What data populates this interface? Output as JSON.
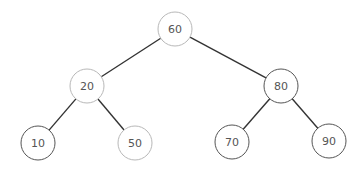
{
  "diagram": {
    "type": "binary-search-tree",
    "colors": {
      "edge": "#333333",
      "border_light": "#b8b8b8",
      "border_dark": "#555555",
      "label": "#555555",
      "background": "#ffffff"
    },
    "nodes": [
      {
        "id": "n60",
        "label": "60",
        "x": 175,
        "y": 29,
        "r": 17,
        "border": "light"
      },
      {
        "id": "n20",
        "label": "20",
        "x": 87,
        "y": 86,
        "r": 17,
        "border": "light"
      },
      {
        "id": "n80",
        "label": "80",
        "x": 281,
        "y": 86,
        "r": 17,
        "border": "dark"
      },
      {
        "id": "n10",
        "label": "10",
        "x": 38,
        "y": 143,
        "r": 17,
        "border": "dark"
      },
      {
        "id": "n50",
        "label": "50",
        "x": 135,
        "y": 143,
        "r": 17,
        "border": "light"
      },
      {
        "id": "n70",
        "label": "70",
        "x": 232,
        "y": 142,
        "r": 17,
        "border": "dark"
      },
      {
        "id": "n90",
        "label": "90",
        "x": 329,
        "y": 141,
        "r": 17,
        "border": "dark"
      }
    ],
    "edges": [
      {
        "from": "n60",
        "to": "n20"
      },
      {
        "from": "n60",
        "to": "n80"
      },
      {
        "from": "n20",
        "to": "n10"
      },
      {
        "from": "n20",
        "to": "n50"
      },
      {
        "from": "n80",
        "to": "n70"
      },
      {
        "from": "n80",
        "to": "n90"
      }
    ]
  }
}
